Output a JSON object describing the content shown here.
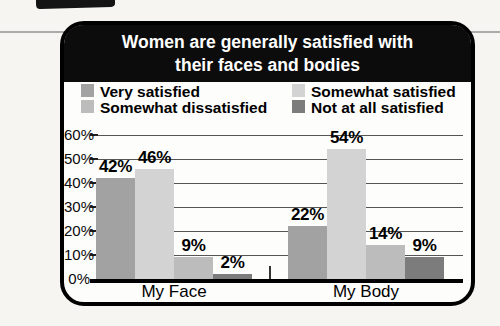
{
  "title": {
    "line1": "Women are generally satisfied with",
    "line2": "their faces and bodies"
  },
  "chart_data": {
    "type": "bar",
    "categories": [
      "My Face",
      "My Body"
    ],
    "series": [
      {
        "name": "Very satisfied",
        "values": [
          42,
          22
        ],
        "data_labels": [
          "42%",
          "22%"
        ],
        "color": "#a2a2a2"
      },
      {
        "name": "Somewhat satisfied",
        "values": [
          46,
          54
        ],
        "data_labels": [
          "46%",
          "54%"
        ],
        "color": "#d3d3d3"
      },
      {
        "name": "Somewhat dissatisfied",
        "values": [
          9,
          14
        ],
        "data_labels": [
          "9%",
          "14%"
        ],
        "color": "#bcbcbc"
      },
      {
        "name": "Not at all satisfied",
        "values": [
          2,
          9
        ],
        "data_labels": [
          "2%",
          "9%"
        ],
        "color": "#7c7c7c"
      }
    ],
    "legend_order": [
      "Very satisfied",
      "Somewhat dissatisfied",
      "Somewhat satisfied",
      "Not at all satisfied"
    ],
    "legend_position": "top, two columns",
    "y_ticks": [
      "0%",
      "10%",
      "20%",
      "30%",
      "40%",
      "50%",
      "60%"
    ],
    "ylim": [
      0,
      60
    ],
    "grid": true,
    "colors": {
      "title_bg": "#0c0c0c",
      "title_text": "#ffffff",
      "panel_bg": "#fdfdfc",
      "frame": "#000000",
      "gridline": "#555555"
    }
  }
}
